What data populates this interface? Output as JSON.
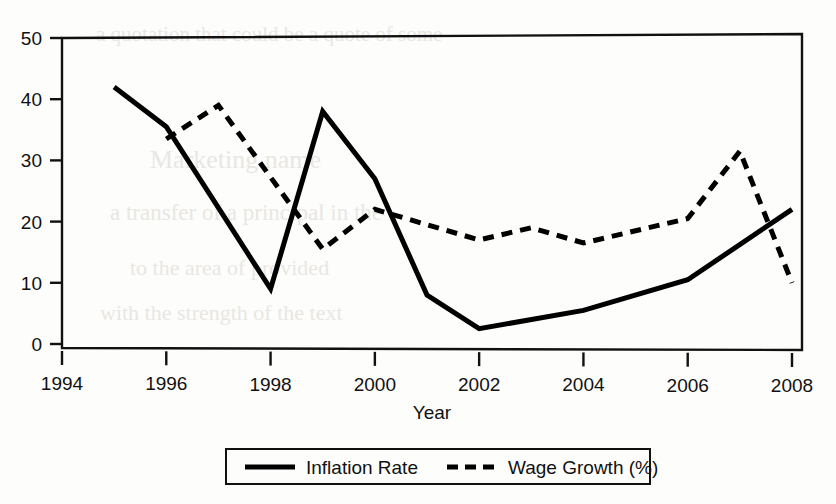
{
  "chart_data": {
    "type": "line",
    "title": "",
    "xlabel": "Year",
    "ylabel": "",
    "xlim": [
      1994,
      2008
    ],
    "ylim": [
      0,
      50
    ],
    "grid": false,
    "legend_position": "bottom",
    "x_ticks": [
      "1994",
      "1996",
      "1998",
      "2000",
      "2002",
      "2004",
      "2006",
      "2008"
    ],
    "y_ticks": [
      "0",
      "10",
      "20",
      "30",
      "40",
      "50"
    ],
    "series": [
      {
        "name": "Inflation Rate",
        "style": "solid",
        "color": "#000000",
        "x": [
          1995,
          1996,
          1998,
          1999,
          2000,
          2001,
          2002,
          2004,
          2006,
          2008
        ],
        "values": [
          42,
          35.5,
          9,
          38,
          27,
          8,
          2.5,
          5.5,
          10.5,
          22
        ]
      },
      {
        "name": "Wage Growth (%)",
        "style": "dashed",
        "color": "#000000",
        "x": [
          1996,
          1997,
          1999,
          2000,
          2002,
          2003,
          2004,
          2006,
          2007,
          2008
        ],
        "values": [
          33.5,
          39,
          15.5,
          22,
          17,
          19,
          16.5,
          20.5,
          31.5,
          10
        ]
      }
    ]
  },
  "legend": {
    "items": [
      {
        "label": "Inflation Rate",
        "style": "solid"
      },
      {
        "label": "Wage Growth (%)",
        "style": "dashed"
      }
    ]
  },
  "axis": {
    "x_title": "Year"
  },
  "ghost_text": {
    "line1": "a quotation that could be a quote of some",
    "line2": "Marketing name",
    "line3": "a transfer of a principal in the",
    "line4": "to the area of provided",
    "line5": "with the strength of the text"
  }
}
